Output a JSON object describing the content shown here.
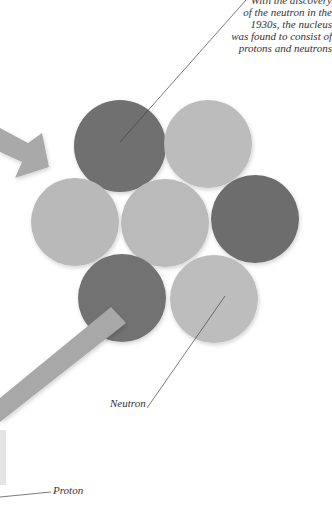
{
  "caption": {
    "lines": [
      "With the discovery",
      "of the neutron in the",
      "1930s, the nucleus",
      "was found to consist of",
      "protons and neutrons"
    ]
  },
  "labels": {
    "neutron": "Neutron",
    "proton": "Proton"
  },
  "colors": {
    "background": "#ffffff",
    "dark_particle": "#6f6f6f",
    "light_particle": "#b9b9b9",
    "arrow": "#a9a9a9",
    "bar": "#a8a8a8",
    "leader_line": "#444444"
  },
  "particles": [
    {
      "id": "top-left",
      "kind": "dark",
      "cx": 120,
      "cy": 146,
      "r": 46
    },
    {
      "id": "top-right",
      "kind": "light",
      "cx": 208,
      "cy": 144,
      "r": 44
    },
    {
      "id": "middle-left",
      "kind": "light",
      "cx": 75,
      "cy": 222,
      "r": 44
    },
    {
      "id": "center",
      "kind": "light",
      "cx": 165,
      "cy": 223,
      "r": 44
    },
    {
      "id": "middle-right",
      "kind": "dark",
      "cx": 255,
      "cy": 219,
      "r": 44
    },
    {
      "id": "bottom-left",
      "kind": "dark",
      "cx": 122,
      "cy": 298,
      "r": 44
    },
    {
      "id": "bottom-right",
      "kind": "light",
      "cx": 214,
      "cy": 299,
      "r": 44
    }
  ]
}
